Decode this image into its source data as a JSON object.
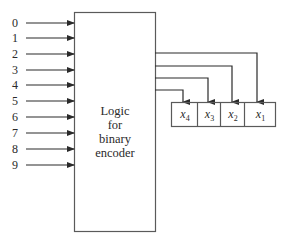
{
  "diagram": {
    "type": "block-diagram",
    "inputs": {
      "labels": [
        "0",
        "1",
        "2",
        "3",
        "4",
        "5",
        "6",
        "7",
        "8",
        "9"
      ]
    },
    "logic_block": {
      "lines": [
        "Logic",
        "for",
        "binary",
        "encoder"
      ]
    },
    "register": {
      "cells": [
        {
          "var": "x",
          "sub": "4"
        },
        {
          "var": "x",
          "sub": "3"
        },
        {
          "var": "x",
          "sub": "2"
        },
        {
          "var": "x",
          "sub": "1"
        }
      ]
    },
    "colors": {
      "line": "#2a2a2a",
      "box": "#5a5a5a",
      "background": "#ffffff"
    }
  }
}
